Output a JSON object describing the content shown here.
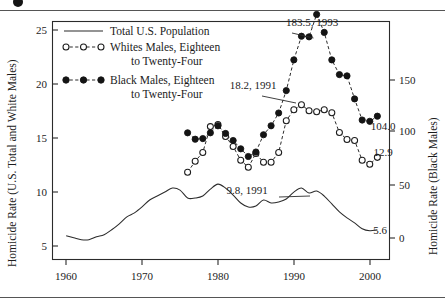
{
  "figure": {
    "top_rule": true,
    "bottom_rule": true,
    "partial_marker_top_left": "black-dot"
  },
  "axes": {
    "x": {
      "label": "",
      "ticks": [
        1960,
        1970,
        1980,
        1990,
        2000
      ],
      "tick_labels": [
        "1960",
        "1970",
        "1980",
        "1990",
        "2000"
      ],
      "range": [
        1958.2,
        2002.6
      ]
    },
    "y_left": {
      "label": "Homicide Rate (U.S. Total and White Males)",
      "ticks": [
        5,
        10,
        15,
        20,
        25
      ],
      "tick_labels": [
        "5",
        "10",
        "15",
        "20",
        "25"
      ],
      "range": [
        2.6,
        26.6
      ]
    },
    "y_right": {
      "label": "Homicide Rate (Black Males)",
      "ticks": [
        0,
        50,
        100,
        150
      ],
      "tick_labels": [
        "0",
        "50",
        "100",
        "150"
      ],
      "range": [
        -8,
        178
      ]
    }
  },
  "legend": {
    "items": [
      {
        "label_line1": "Total U.S. Population",
        "label_line2": "",
        "marker": "solid-line"
      },
      {
        "label_line1": "Whites Males, Eighteen",
        "label_line2": "to Twenty-Four",
        "marker": "open-circle-dashed"
      },
      {
        "label_line1": "Black Males, Eighteen",
        "label_line2": "to Twenty-Four",
        "marker": "filled-circle-dashed"
      }
    ]
  },
  "annotations": [
    {
      "name": "black-peak-label",
      "text": "183.5, 1993",
      "x": 312,
      "y": 26,
      "anchor": "middle"
    },
    {
      "name": "white-peak-label",
      "text": "18.2, 1991",
      "x": 253,
      "y": 89,
      "anchor": "middle"
    },
    {
      "name": "total-peak-label",
      "text": "9.8, 1991",
      "x": 247,
      "y": 194,
      "anchor": "middle"
    },
    {
      "name": "black-end-label",
      "text": "104.0",
      "x": 383,
      "y": 130,
      "anchor": "middle"
    },
    {
      "name": "white-end-label",
      "text": "12.9",
      "x": 383,
      "y": 156,
      "anchor": "middle"
    },
    {
      "name": "total-end-label",
      "text": "5.6",
      "x": 380,
      "y": 234,
      "anchor": "middle"
    }
  ],
  "chart_data": {
    "type": "line",
    "title": "",
    "xlabel": "",
    "ylabel": "Homicide Rate (U.S. Total and White Males)",
    "ylabel_right": "Homicide Rate (Black Males)",
    "xlim": [
      1958.2,
      2002.6
    ],
    "ylim": [
      2.6,
      26.6
    ],
    "ylim_right": [
      -8,
      178
    ],
    "grid": false,
    "legend_position": "top-left-inside",
    "series": [
      {
        "name": "Total U.S. Population",
        "axis": "left",
        "style": "solid-line",
        "marker": "none",
        "x": [
          1960,
          1961,
          1962,
          1963,
          1964,
          1965,
          1966,
          1967,
          1968,
          1969,
          1970,
          1971,
          1972,
          1973,
          1974,
          1975,
          1976,
          1977,
          1978,
          1979,
          1980,
          1981,
          1982,
          1983,
          1984,
          1985,
          1986,
          1987,
          1988,
          1989,
          1990,
          1991,
          1992,
          1993,
          1994,
          1995,
          1996,
          1997,
          1998,
          1999,
          2000,
          2001
        ],
        "values": [
          5.0,
          4.8,
          4.6,
          4.6,
          4.9,
          5.1,
          5.6,
          6.2,
          6.9,
          7.3,
          7.9,
          8.6,
          9.0,
          9.4,
          9.8,
          9.6,
          8.8,
          8.8,
          9.0,
          9.7,
          10.2,
          9.8,
          9.1,
          8.3,
          7.9,
          8.0,
          8.6,
          8.3,
          8.4,
          8.7,
          9.4,
          9.8,
          9.3,
          9.5,
          9.0,
          8.2,
          7.4,
          6.8,
          6.3,
          5.7,
          5.5,
          5.6
        ]
      },
      {
        "name": "Whites Males, Eighteen to Twenty-Four",
        "axis": "left",
        "style": "dashed-line",
        "marker": "open-circle",
        "x": [
          1976,
          1977,
          1978,
          1979,
          1980,
          1981,
          1982,
          1983,
          1984,
          1985,
          1986,
          1987,
          1988,
          1989,
          1990,
          1991,
          1992,
          1993,
          1994,
          1995,
          1996,
          1997,
          1998,
          1999,
          2000,
          2001
        ],
        "values": [
          11.4,
          12.5,
          13.4,
          16.0,
          16.2,
          15.0,
          14.0,
          12.6,
          11.9,
          13.3,
          12.4,
          12.4,
          13.4,
          16.6,
          17.7,
          18.2,
          17.6,
          17.5,
          17.7,
          17.4,
          15.4,
          14.7,
          14.6,
          12.6,
          12.2,
          12.9
        ]
      },
      {
        "name": "Black Males, Eighteen to Twenty-Four",
        "axis": "right",
        "style": "dashed-line",
        "marker": "filled-circle",
        "x": [
          1976,
          1977,
          1978,
          1979,
          1980,
          1981,
          1982,
          1983,
          1984,
          1985,
          1986,
          1987,
          1988,
          1989,
          1990,
          1991,
          1992,
          1993,
          1994,
          1995,
          1996,
          1997,
          1998,
          1999,
          2000,
          2001
        ],
        "values": [
          91.0,
          86.0,
          86.5,
          91.0,
          96.5,
          90.5,
          85.0,
          78.5,
          72.5,
          76.0,
          89.5,
          96.5,
          106.5,
          124.0,
          148.0,
          166.5,
          166.0,
          183.5,
          169.5,
          148.0,
          136.5,
          135.5,
          117.5,
          101.0,
          100.0,
          104.0
        ]
      }
    ],
    "annotations": [
      {
        "text": "183.5, 1993",
        "series": "Black Males, Eighteen to Twenty-Four",
        "x": 1993,
        "value": 183.5
      },
      {
        "text": "18.2, 1991",
        "series": "Whites Males, Eighteen to Twenty-Four",
        "x": 1991,
        "value": 18.2
      },
      {
        "text": "9.8, 1991",
        "series": "Total U.S. Population",
        "x": 1991,
        "value": 9.8
      },
      {
        "text": "104.0",
        "series": "Black Males, Eighteen to Twenty-Four",
        "x": 2001,
        "value": 104.0
      },
      {
        "text": "12.9",
        "series": "Whites Males, Eighteen to Twenty-Four",
        "x": 2001,
        "value": 12.9
      },
      {
        "text": "5.6",
        "series": "Total U.S. Population",
        "x": 2001,
        "value": 5.6
      }
    ]
  }
}
